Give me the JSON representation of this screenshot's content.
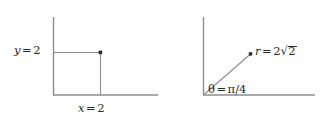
{
  "figure": {
    "background_color": "#ffffff",
    "line_color": "#8d8d8d",
    "text_color": "#2b2b2b",
    "width": 323,
    "height": 126
  },
  "panels": [
    {
      "id": "cartesian",
      "name": "cartesian-coordinates-diagram",
      "description": "Point in the first quadrant shown with rectangular coordinates",
      "axes": {
        "y_axis": {
          "x": 53,
          "y_top": 17,
          "y_bottom": 95
        },
        "x_axis": {
          "y": 95,
          "x_left": 53,
          "x_right": 158
        }
      },
      "point": {
        "x": 100,
        "y": 52,
        "coords": "(2, 2)"
      },
      "guides": [
        {
          "from": [
            53,
            52
          ],
          "to": [
            100,
            52
          ],
          "orientation": "horizontal"
        },
        {
          "from": [
            100,
            52
          ],
          "to": [
            100,
            95
          ],
          "orientation": "vertical"
        }
      ],
      "labels": {
        "y_label": {
          "var": "y",
          "op": "=",
          "value": "2",
          "x": 14,
          "y": 45
        },
        "x_label": {
          "var": "x",
          "op": "=",
          "value": "2",
          "x": 78,
          "y": 103
        }
      }
    },
    {
      "id": "polar",
      "name": "polar-coordinates-diagram",
      "description": "Same point shown with polar coordinates r and theta",
      "axes": {
        "y_axis": {
          "x": 203,
          "y_top": 17,
          "y_bottom": 95
        },
        "x_axis": {
          "y": 95,
          "x_left": 203,
          "x_right": 315
        }
      },
      "point": {
        "x": 250,
        "y": 54,
        "coords": "(2√2, π/4)"
      },
      "ray": {
        "from": [
          203,
          95
        ],
        "to": [
          250,
          54
        ],
        "angle_deg": 45
      },
      "labels": {
        "r_label": {
          "var": "r",
          "op": "=",
          "coefficient": "2",
          "surd": "√",
          "radicand": "2",
          "value": "2√2",
          "x": 255,
          "y": 46
        },
        "theta_label": {
          "var": "θ",
          "op": "=",
          "numerator": "π",
          "slash": "/",
          "denominator": "4",
          "value": "π/4",
          "x": 208,
          "y": 84
        }
      }
    }
  ]
}
